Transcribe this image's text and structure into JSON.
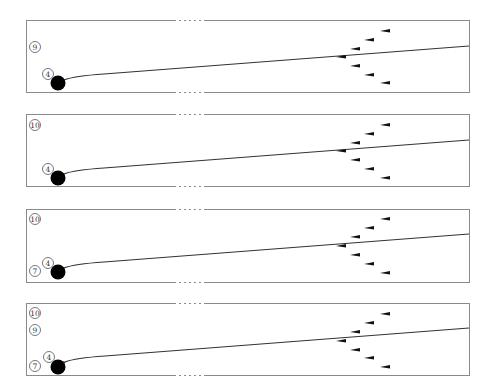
{
  "figure": {
    "type": "bowling-lane-diagram",
    "panels": [
      {
        "id": "panel-1",
        "box": {
          "x": 26,
          "y": 20,
          "w": 443,
          "h": 72
        },
        "labels": [
          {
            "text": "9",
            "x": 35,
            "y": 47
          }
        ],
        "ball": {
          "label": "4",
          "cx": 58,
          "cy": 83,
          "r": 7.5,
          "label_x": 48,
          "label_y": 74
        },
        "path": {
          "start_x": 469,
          "start_y": 46,
          "end_x": 64,
          "end_y": 80
        },
        "pins": [
          [
            385,
            31
          ],
          [
            369,
            40
          ],
          [
            355,
            49
          ],
          [
            341,
            57
          ],
          [
            355,
            66
          ],
          [
            369,
            75
          ],
          [
            385,
            83
          ]
        ]
      },
      {
        "id": "panel-2",
        "box": {
          "x": 26,
          "y": 114,
          "w": 443,
          "h": 72
        },
        "labels": [
          {
            "text": "10",
            "x": 35,
            "y": 125
          }
        ],
        "ball": {
          "label": "4",
          "cx": 58,
          "cy": 178,
          "r": 7.5,
          "label_x": 48,
          "label_y": 169
        },
        "path": {
          "start_x": 469,
          "start_y": 140,
          "end_x": 64,
          "end_y": 174
        },
        "pins": [
          [
            385,
            125
          ],
          [
            369,
            134
          ],
          [
            355,
            143
          ],
          [
            341,
            151
          ],
          [
            355,
            160
          ],
          [
            369,
            169
          ],
          [
            385,
            178
          ]
        ]
      },
      {
        "id": "panel-3",
        "box": {
          "x": 26,
          "y": 209,
          "w": 443,
          "h": 73
        },
        "labels": [
          {
            "text": "10",
            "x": 35,
            "y": 219
          },
          {
            "text": "7",
            "x": 35,
            "y": 271
          }
        ],
        "ball": {
          "label": "4",
          "cx": 58,
          "cy": 272,
          "r": 7.5,
          "label_x": 48,
          "label_y": 263
        },
        "path": {
          "start_x": 469,
          "start_y": 234,
          "end_x": 64,
          "end_y": 268
        },
        "pins": [
          [
            385,
            219
          ],
          [
            369,
            228
          ],
          [
            355,
            237
          ],
          [
            341,
            246
          ],
          [
            355,
            255
          ],
          [
            369,
            264
          ],
          [
            385,
            273
          ]
        ]
      },
      {
        "id": "panel-4",
        "box": {
          "x": 26,
          "y": 303,
          "w": 443,
          "h": 72
        },
        "labels": [
          {
            "text": "10",
            "x": 35,
            "y": 313
          },
          {
            "text": "9",
            "x": 35,
            "y": 330
          },
          {
            "text": "7",
            "x": 35,
            "y": 366
          }
        ],
        "ball": {
          "label": "4",
          "cx": 58,
          "cy": 367,
          "r": 7.5,
          "label_x": 49,
          "label_y": 357
        },
        "path": {
          "start_x": 469,
          "start_y": 328,
          "end_x": 65,
          "end_y": 362
        },
        "pins": [
          [
            385,
            314
          ],
          [
            369,
            323
          ],
          [
            355,
            332
          ],
          [
            341,
            341
          ],
          [
            355,
            350
          ],
          [
            369,
            358
          ],
          [
            385,
            367
          ]
        ]
      }
    ],
    "colors": {
      "border": "#8a8a8a",
      "path": "#333333",
      "ball": "#000000",
      "pin": "#111111"
    }
  }
}
